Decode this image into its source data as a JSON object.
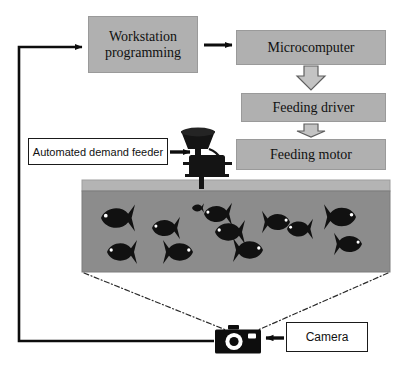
{
  "diagram": {
    "nodes": {
      "workstation": {
        "label": "Workstation programming",
        "shape": "rectangle",
        "fill": "#b0b0b0"
      },
      "microcomputer": {
        "label": "Microcomputer",
        "shape": "rectangle",
        "fill": "#b0b0b0"
      },
      "feeding_driver": {
        "label": "Feeding driver",
        "shape": "rectangle",
        "fill": "#b0b0b0"
      },
      "feeding_motor": {
        "label": "Feeding motor",
        "shape": "rectangle",
        "fill": "#b0b0b0"
      },
      "feeder_label": {
        "label": "Automated demand feeder",
        "shape": "rectangle",
        "fill": "#ffffff"
      },
      "camera_label": {
        "label": "Camera",
        "shape": "rectangle",
        "fill": "#ffffff"
      }
    },
    "icons": {
      "feeder": "hopper-feeder-icon",
      "camera": "camera-icon"
    },
    "tank": {
      "rim_color": "#b4b4b4",
      "water_color": "#8c8c8c",
      "fish_color": "#111111",
      "fish_count": 12,
      "fish": [
        {
          "x": 118,
          "y": 218,
          "len": 34,
          "dir": "left"
        },
        {
          "x": 166,
          "y": 228,
          "len": 28,
          "dir": "left"
        },
        {
          "x": 218,
          "y": 214,
          "len": 28,
          "dir": "left"
        },
        {
          "x": 230,
          "y": 232,
          "len": 30,
          "dir": "left"
        },
        {
          "x": 276,
          "y": 222,
          "len": 28,
          "dir": "right"
        },
        {
          "x": 300,
          "y": 229,
          "len": 26,
          "dir": "left"
        },
        {
          "x": 340,
          "y": 217,
          "len": 32,
          "dir": "right"
        },
        {
          "x": 348,
          "y": 244,
          "len": 28,
          "dir": "right"
        },
        {
          "x": 122,
          "y": 252,
          "len": 30,
          "dir": "left"
        },
        {
          "x": 178,
          "y": 252,
          "len": 30,
          "dir": "right"
        },
        {
          "x": 248,
          "y": 250,
          "len": 30,
          "dir": "right"
        },
        {
          "x": 198,
          "y": 208,
          "len": 12,
          "dir": "left"
        }
      ]
    },
    "connectors": {
      "workstation_to_microcomputer": "solid-arrow-right",
      "microcomputer_to_feeding_driver": "block-arrow-down",
      "feeding_driver_to_feeding_motor": "block-arrow-down",
      "feeder_label_to_feeder": "solid-arrow-right",
      "camera_label_to_camera": "solid-arrow-left",
      "camera_to_workstation": "feedback-loop-solid",
      "tank_to_camera": "dash-dot-field-of-view"
    }
  }
}
